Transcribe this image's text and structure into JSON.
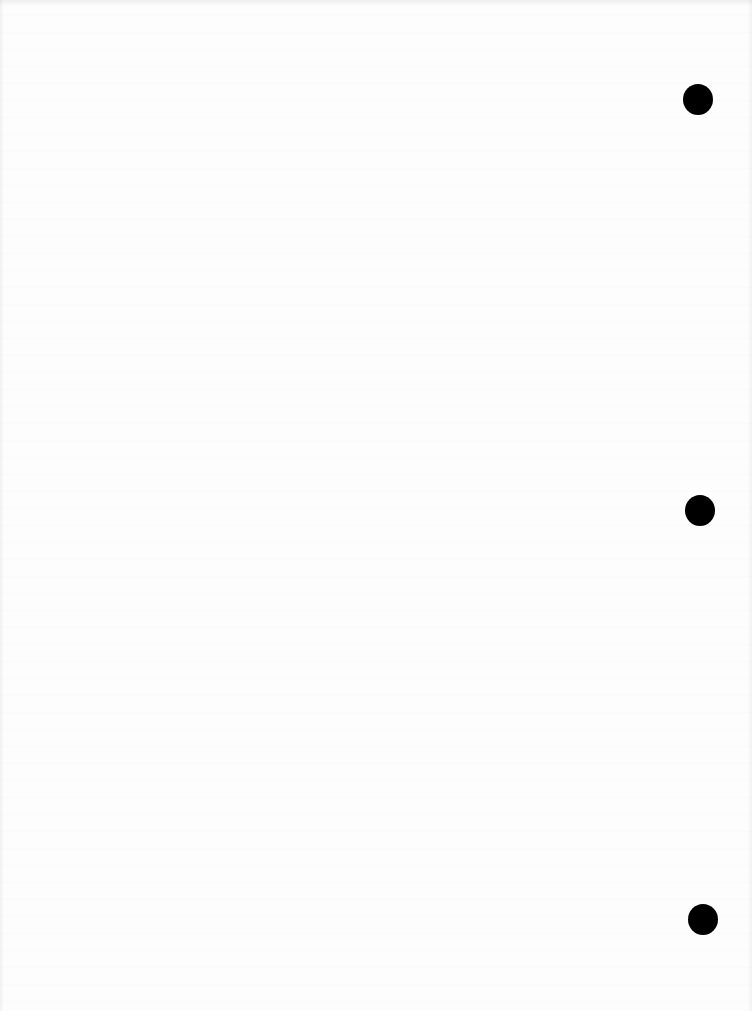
{
  "document": {
    "type": "scanned-page",
    "content_text": "",
    "background_color": "#fdfdfd",
    "punch_holes": [
      {
        "id": "hole-1",
        "color": "#000000"
      },
      {
        "id": "hole-2",
        "color": "#000000"
      },
      {
        "id": "hole-3",
        "color": "#000000"
      }
    ]
  }
}
